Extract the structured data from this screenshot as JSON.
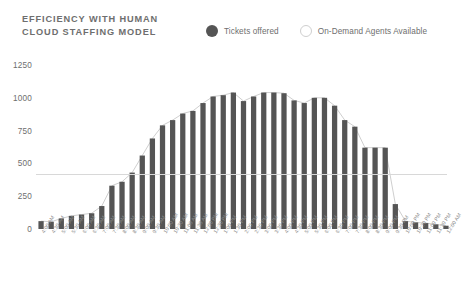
{
  "header": {
    "title": "EFFICIENCY WITH HUMAN\nCLOUD STAFFING MODEL"
  },
  "legend": {
    "items": [
      {
        "label": "Tickets offered",
        "marker": "filled-circle-icon",
        "color": "#555555"
      },
      {
        "label": "On-Demand Agents Available",
        "marker": "hollow-circle-icon",
        "color": "#ffffff"
      }
    ]
  },
  "colors": {
    "bar": "#555555",
    "line": "#cfcfcf",
    "axis": "#d8d8d8",
    "text": "#6e6e6e",
    "tick_text": "#8a8a8a",
    "background": "#ffffff"
  },
  "chart_data": {
    "type": "bar",
    "title": "EFFICIENCY WITH HUMAN CLOUD STAFFING MODEL",
    "xlabel": "",
    "ylabel": "",
    "ylim": [
      0,
      1250
    ],
    "yticks": [
      0,
      250,
      500,
      750,
      1000,
      1250
    ],
    "ytick_labels": [
      "0",
      "250",
      "500",
      "750",
      "1000",
      "1250"
    ],
    "grid": false,
    "legend_position": "top-right",
    "categories": [
      "4:00 AM",
      "4:30 AM",
      "5:00 AM",
      "5:30 AM",
      "6:00 AM",
      "6:30 AM",
      "7:00 AM",
      "7:30 AM",
      "8:00 AM",
      "8:30 AM",
      "9:00 AM",
      "9:30 AM",
      "10:00 AM",
      "10:30 AM",
      "11:00 AM",
      "11:30 AM",
      "12:00 PM",
      "12:30 PM",
      "1:00 PM",
      "1:30 PM",
      "2:00 PM",
      "2:30 PM",
      "3:00 PM",
      "3:30 PM",
      "4:00 PM",
      "4:30 PM",
      "5:00 PM",
      "5:30 PM",
      "6:00 PM",
      "6:30 PM",
      "7:00 PM",
      "7:30 PM",
      "8:00 PM",
      "8:30 PM",
      "9:00 PM",
      "9:30 PM",
      "10:00 PM",
      "10:30 PM",
      "11:00 PM",
      "11:30 PM",
      "12:00 AM"
    ],
    "series": [
      {
        "name": "Tickets offered",
        "type": "bar",
        "color": "#555555",
        "values": [
          60,
          55,
          80,
          100,
          110,
          120,
          175,
          330,
          360,
          430,
          560,
          690,
          790,
          830,
          880,
          900,
          960,
          1010,
          1020,
          1040,
          975,
          1010,
          1040,
          1040,
          1035,
          980,
          960,
          1000,
          1000,
          940,
          830,
          780,
          620,
          620,
          620,
          190,
          60,
          50,
          45,
          35,
          25
        ]
      },
      {
        "name": "On-Demand Agents Available",
        "type": "line",
        "color": "#cfcfcf",
        "values": [
          60,
          55,
          80,
          100,
          110,
          120,
          175,
          330,
          360,
          430,
          560,
          690,
          790,
          830,
          880,
          900,
          960,
          1010,
          1020,
          1040,
          975,
          1010,
          1040,
          1040,
          1035,
          980,
          960,
          1000,
          1000,
          940,
          830,
          780,
          620,
          620,
          620,
          190,
          60,
          50,
          45,
          35,
          25
        ]
      }
    ]
  }
}
